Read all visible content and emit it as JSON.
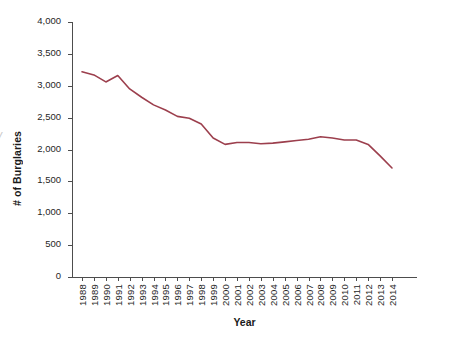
{
  "chart_data": {
    "type": "line",
    "title": "",
    "xlabel": "Year",
    "ylabel": "# of Burglaries",
    "x": [
      1988,
      1989,
      1990,
      1991,
      1992,
      1993,
      1994,
      1995,
      1996,
      1997,
      1998,
      1999,
      2000,
      2001,
      2002,
      2003,
      2004,
      2005,
      2006,
      2007,
      2008,
      2009,
      2010,
      2011,
      2012,
      2013,
      2014
    ],
    "categories": [
      "1988",
      "1989",
      "1990",
      "1991",
      "1992",
      "1993",
      "1994",
      "1995",
      "1996",
      "1997",
      "1998",
      "1999",
      "2000",
      "2001",
      "2002",
      "2003",
      "2004",
      "2005",
      "2006",
      "2007",
      "2008",
      "2009",
      "2010",
      "2011",
      "2012",
      "2013",
      "2014"
    ],
    "values": [
      3220,
      3170,
      3060,
      3160,
      2950,
      2820,
      2700,
      2620,
      2520,
      2490,
      2400,
      2180,
      2080,
      2110,
      2110,
      2090,
      2100,
      2120,
      2140,
      2160,
      2200,
      2180,
      2150,
      2150,
      2080,
      1900,
      1710
    ],
    "series": [
      {
        "name": "# of Burglaries",
        "color": "#9c3f4d",
        "values": [
          3220,
          3170,
          3060,
          3160,
          2950,
          2820,
          2700,
          2620,
          2520,
          2490,
          2400,
          2180,
          2080,
          2110,
          2110,
          2090,
          2100,
          2120,
          2140,
          2160,
          2200,
          2180,
          2150,
          2150,
          2080,
          1900,
          1710
        ]
      }
    ],
    "ylim": [
      0,
      4000
    ],
    "ytick_values": [
      0,
      500,
      1000,
      1500,
      2000,
      2500,
      3000,
      3500,
      4000
    ],
    "ytick_labels": [
      "0",
      "500",
      "1,000",
      "1,500",
      "2,000",
      "2,500",
      "3,000",
      "3,500",
      "4,000"
    ],
    "grid": false,
    "legend": "none",
    "line_color": "#9c3f4d",
    "axis_color": "#4d4d4d",
    "background": "#ffffff"
  },
  "artifact": {
    "edge_glyph": "/"
  }
}
